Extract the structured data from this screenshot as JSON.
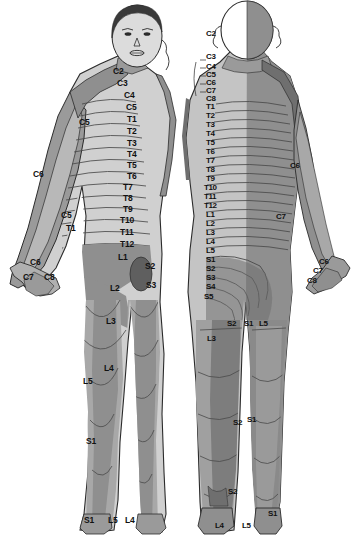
{
  "figure": {
    "views": [
      {
        "name": "anterior",
        "caption": "Anterior (front) view"
      },
      {
        "name": "posterior",
        "caption": "Posterior (back) view"
      }
    ],
    "colors": {
      "background": "#ffffff",
      "skin_light": "#d8d8d8",
      "skin_mid": "#bdbdbd",
      "band_dark": "#8f8f8f",
      "band_darker": "#6f6f6f",
      "hair": "#3a3a3a",
      "outline": "#2b2b2b",
      "label_text": "#111111"
    }
  },
  "chart_data": {
    "type": "diagram",
    "xlabel": "",
    "ylabel": "",
    "legend": [],
    "series": [
      {
        "name": "anterior",
        "values": [
          {
            "label": "C2",
            "x": 113,
            "y": 67
          },
          {
            "label": "C3",
            "x": 117,
            "y": 79
          },
          {
            "label": "C4",
            "x": 124,
            "y": 91
          },
          {
            "label": "C5",
            "x": 126,
            "y": 103
          },
          {
            "label": "C5",
            "x": 79,
            "y": 118
          },
          {
            "label": "T1",
            "x": 127,
            "y": 115
          },
          {
            "label": "T2",
            "x": 127,
            "y": 127
          },
          {
            "label": "T3",
            "x": 127,
            "y": 139
          },
          {
            "label": "T4",
            "x": 127,
            "y": 150
          },
          {
            "label": "T5",
            "x": 127,
            "y": 161
          },
          {
            "label": "T6",
            "x": 127,
            "y": 172
          },
          {
            "label": "C6",
            "x": 33,
            "y": 170
          },
          {
            "label": "T7",
            "x": 123,
            "y": 183
          },
          {
            "label": "T8",
            "x": 123,
            "y": 194
          },
          {
            "label": "T9",
            "x": 123,
            "y": 205
          },
          {
            "label": "C5",
            "x": 61,
            "y": 211
          },
          {
            "label": "T10",
            "x": 120,
            "y": 216
          },
          {
            "label": "T1",
            "x": 66,
            "y": 224
          },
          {
            "label": "T11",
            "x": 120,
            "y": 228
          },
          {
            "label": "T12",
            "x": 120,
            "y": 240
          },
          {
            "label": "C6",
            "x": 30,
            "y": 258
          },
          {
            "label": "L1",
            "x": 118,
            "y": 253
          },
          {
            "label": "S2",
            "x": 145,
            "y": 262
          },
          {
            "label": "C7",
            "x": 23,
            "y": 273
          },
          {
            "label": "C8",
            "x": 44,
            "y": 273
          },
          {
            "label": "S3",
            "x": 146,
            "y": 281
          },
          {
            "label": "L2",
            "x": 110,
            "y": 284
          },
          {
            "label": "L3",
            "x": 106,
            "y": 317
          },
          {
            "label": "L4",
            "x": 104,
            "y": 364
          },
          {
            "label": "L5",
            "x": 83,
            "y": 377
          },
          {
            "label": "S1",
            "x": 86,
            "y": 437
          },
          {
            "label": "S1",
            "x": 84,
            "y": 516
          },
          {
            "label": "L5",
            "x": 108,
            "y": 516
          },
          {
            "label": "L4",
            "x": 125,
            "y": 516
          }
        ]
      },
      {
        "name": "posterior",
        "values": [
          {
            "label": "C2",
            "x": 206,
            "y": 30
          },
          {
            "label": "C3",
            "x": 206,
            "y": 53
          },
          {
            "label": "C4",
            "x": 206,
            "y": 63
          },
          {
            "label": "C5",
            "x": 206,
            "y": 71
          },
          {
            "label": "C6",
            "x": 206,
            "y": 79
          },
          {
            "label": "C7",
            "x": 206,
            "y": 87
          },
          {
            "label": "C8",
            "x": 206,
            "y": 95
          },
          {
            "label": "T1",
            "x": 206,
            "y": 103
          },
          {
            "label": "T2",
            "x": 206,
            "y": 112
          },
          {
            "label": "T3",
            "x": 206,
            "y": 121
          },
          {
            "label": "T4",
            "x": 206,
            "y": 130
          },
          {
            "label": "T5",
            "x": 206,
            "y": 139
          },
          {
            "label": "T6",
            "x": 206,
            "y": 148
          },
          {
            "label": "T7",
            "x": 206,
            "y": 157
          },
          {
            "label": "T8",
            "x": 206,
            "y": 166
          },
          {
            "label": "T9",
            "x": 206,
            "y": 175
          },
          {
            "label": "T10",
            "x": 204,
            "y": 184
          },
          {
            "label": "T11",
            "x": 204,
            "y": 193
          },
          {
            "label": "T12",
            "x": 204,
            "y": 202
          },
          {
            "label": "L1",
            "x": 206,
            "y": 211
          },
          {
            "label": "L2",
            "x": 206,
            "y": 220
          },
          {
            "label": "L3",
            "x": 206,
            "y": 229
          },
          {
            "label": "L4",
            "x": 206,
            "y": 238
          },
          {
            "label": "L5",
            "x": 206,
            "y": 247
          },
          {
            "label": "S1",
            "x": 206,
            "y": 256
          },
          {
            "label": "S2",
            "x": 206,
            "y": 265
          },
          {
            "label": "S3",
            "x": 206,
            "y": 274
          },
          {
            "label": "S4",
            "x": 206,
            "y": 283
          },
          {
            "label": "S5",
            "x": 204,
            "y": 293
          },
          {
            "label": "C6",
            "x": 290,
            "y": 162
          },
          {
            "label": "C7",
            "x": 276,
            "y": 213
          },
          {
            "label": "C6",
            "x": 319,
            "y": 258
          },
          {
            "label": "C7",
            "x": 313,
            "y": 267
          },
          {
            "label": "C8",
            "x": 307,
            "y": 277
          },
          {
            "label": "S2",
            "x": 227,
            "y": 320
          },
          {
            "label": "S1",
            "x": 244,
            "y": 320
          },
          {
            "label": "L5",
            "x": 259,
            "y": 320
          },
          {
            "label": "L3",
            "x": 207,
            "y": 335
          },
          {
            "label": "S2",
            "x": 233,
            "y": 419
          },
          {
            "label": "S1",
            "x": 247,
            "y": 416
          },
          {
            "label": "S2",
            "x": 228,
            "y": 488
          },
          {
            "label": "S1",
            "x": 268,
            "y": 510
          },
          {
            "label": "L4",
            "x": 215,
            "y": 522
          },
          {
            "label": "L5",
            "x": 242,
            "y": 522
          }
        ]
      }
    ]
  }
}
